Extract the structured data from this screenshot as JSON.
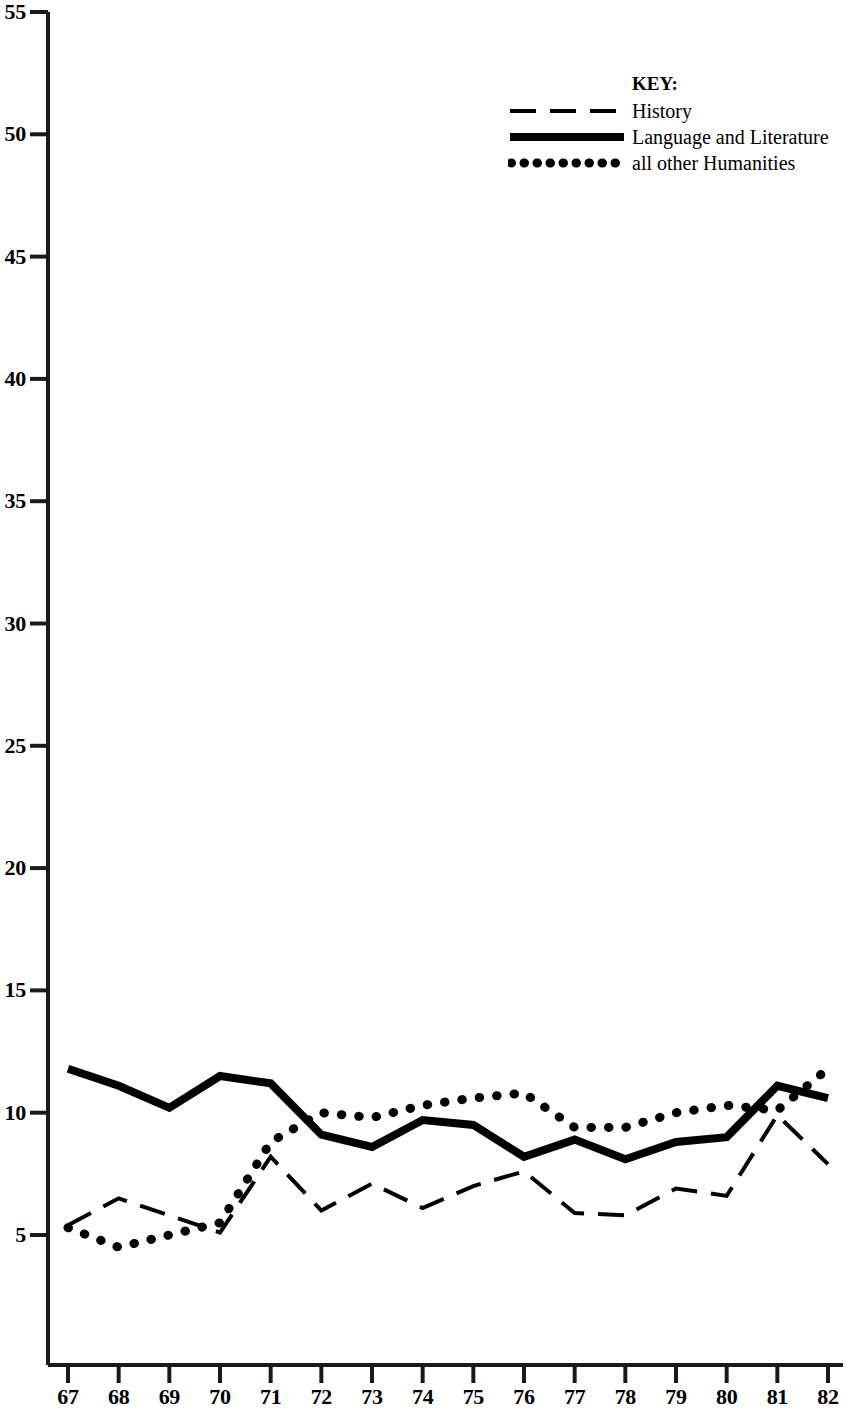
{
  "chart_data": {
    "type": "line",
    "title": "",
    "subtitle": "",
    "xlabel": "",
    "ylabel": "",
    "x": [
      67,
      68,
      69,
      70,
      71,
      72,
      73,
      74,
      75,
      76,
      77,
      78,
      79,
      80,
      81,
      82
    ],
    "x_tick_labels": [
      "67",
      "68",
      "69",
      "70",
      "71",
      "72",
      "73",
      "74",
      "75",
      "76",
      "77",
      "78",
      "79",
      "80",
      "81",
      "82"
    ],
    "y_tick_labels": [
      "5",
      "10",
      "15",
      "20",
      "25",
      "30",
      "35",
      "40",
      "45",
      "50",
      "55"
    ],
    "y_ticks": [
      5,
      10,
      15,
      20,
      25,
      30,
      35,
      40,
      45,
      50,
      55
    ],
    "ylim": [
      0,
      55
    ],
    "xlim": [
      67,
      82
    ],
    "grid": false,
    "legend_position": "top-right",
    "legend_title": "KEY:",
    "series": [
      {
        "name": "History",
        "style": "dashed",
        "color": "#000000",
        "values": [
          5.4,
          6.5,
          5.8,
          5.1,
          8.2,
          6.0,
          7.1,
          6.1,
          7.0,
          7.6,
          5.9,
          5.8,
          6.9,
          6.6,
          9.9,
          7.9
        ]
      },
      {
        "name": "Language and Literature",
        "style": "solid",
        "color": "#000000",
        "values": [
          11.8,
          11.1,
          10.2,
          11.5,
          11.2,
          9.1,
          8.6,
          9.7,
          9.5,
          8.2,
          8.9,
          8.1,
          8.8,
          9.0,
          11.1,
          10.6
        ]
      },
      {
        "name": "all other Humanities",
        "style": "dotted",
        "color": "#000000",
        "values": [
          5.3,
          4.5,
          5.0,
          5.5,
          8.8,
          10.0,
          9.8,
          10.3,
          10.6,
          10.8,
          9.4,
          9.4,
          10.0,
          10.3,
          10.1,
          11.8
        ]
      }
    ]
  },
  "axes": {
    "y_axis_name": "vertical-axis",
    "x_axis_name": "horizontal-axis"
  }
}
